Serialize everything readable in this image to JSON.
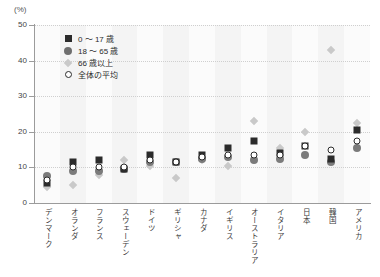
{
  "chart_data": {
    "type": "scatter",
    "title": "",
    "xlabel": "",
    "ylabel": "(%)",
    "ylim": [
      0,
      50
    ],
    "yticks": [
      0,
      10,
      20,
      30,
      40,
      50
    ],
    "ytick_labels": [
      "0",
      "10",
      "20",
      "30",
      "40",
      "50"
    ],
    "grid": true,
    "legend_position": "top-left",
    "categories": [
      "デンマーク",
      "オランダ",
      "フランス",
      "スウェーデン",
      "ドイツ",
      "ギリシャ",
      "カナダ",
      "イギリス",
      "オーストラリア",
      "イタリア",
      "日本",
      "韓国",
      "アメリカ"
    ],
    "series": [
      {
        "name": "0～17歳",
        "marker": "square",
        "color": "#2b2b2b",
        "values": [
          5.5,
          11.5,
          12.0,
          9.5,
          13.5,
          11.5,
          13.5,
          15.5,
          17.5,
          14.0,
          16.0,
          12.5,
          20.5
        ]
      },
      {
        "name": "18～65歳",
        "marker": "circle-filled",
        "color": "#7b7b7b",
        "values": [
          7.5,
          9.0,
          9.0,
          9.5,
          11.5,
          11.5,
          12.5,
          13.0,
          12.0,
          12.5,
          13.5,
          11.5,
          15.5
        ]
      },
      {
        "name": "66歳以上",
        "marker": "diamond",
        "color": "#c9c9c9",
        "values": [
          4.5,
          5.0,
          8.0,
          12.0,
          10.5,
          7.0,
          12.0,
          10.5,
          23.0,
          15.5,
          20.0,
          43.0,
          22.5
        ]
      },
      {
        "name": "全体の平均",
        "marker": "circle-open",
        "color": "#2b2b2b",
        "values": [
          6.5,
          10.0,
          10.0,
          10.0,
          12.0,
          11.5,
          13.0,
          13.5,
          13.5,
          13.5,
          16.0,
          15.0,
          17.5
        ]
      }
    ]
  },
  "legend": {
    "items": [
      {
        "label": "0 ～ 17 歳",
        "marker": "square"
      },
      {
        "label": "18 ～ 65 歳",
        "marker": "circle-filled"
      },
      {
        "label": "66 歳以上",
        "marker": "diamond"
      },
      {
        "label": "全体の平均",
        "marker": "circle-open"
      }
    ]
  },
  "axis": {
    "unit_label": "(%)"
  }
}
